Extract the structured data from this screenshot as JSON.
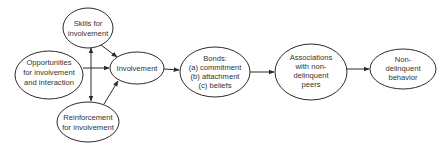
{
  "diagram": {
    "type": "flow-diagram",
    "colors": {
      "stroke": "#2b2b2b",
      "text": "#333333",
      "background": "#ffffff"
    },
    "nodes": [
      {
        "id": "skills",
        "lines": [
          "Skills for",
          "involvement"
        ],
        "cx": 88,
        "cy": 28,
        "rx": 25,
        "ry": 20
      },
      {
        "id": "opportunities",
        "lines": [
          "Opportunities",
          "for involvement",
          "and interaction"
        ],
        "cx": 49,
        "cy": 75,
        "rx": 34,
        "ry": 24
      },
      {
        "id": "reinforcement",
        "lines": [
          "Reinforcement",
          "for involvement"
        ],
        "cx": 88,
        "cy": 122,
        "rx": 31,
        "ry": 20
      },
      {
        "id": "involvement",
        "lines": [
          "Involvement"
        ],
        "cx": 137,
        "cy": 68,
        "rx": 27,
        "ry": 16
      },
      {
        "id": "bonds",
        "lines": [
          "Bonds:",
          "(a) commitment",
          "(b) attachment",
          "(c) beliefs"
        ],
        "cx": 215,
        "cy": 72,
        "rx": 35,
        "ry": 25
      },
      {
        "id": "associations",
        "lines": [
          "Associations",
          "with non-",
          "delinquent",
          "peers"
        ],
        "cx": 311,
        "cy": 72,
        "rx": 36,
        "ry": 28
      },
      {
        "id": "nondelinquent",
        "lines": [
          "Non-",
          "delinquent",
          "behavior"
        ],
        "cx": 403,
        "cy": 69,
        "rx": 33,
        "ry": 20
      }
    ],
    "edges": [
      {
        "from": "opportunities",
        "to": "involvement"
      },
      {
        "from": "skills",
        "to": "involvement"
      },
      {
        "from": "reinforcement",
        "to": "involvement"
      },
      {
        "from": "skills",
        "to": "reinforcement",
        "bidirectional": true
      },
      {
        "from": "involvement",
        "to": "bonds"
      },
      {
        "from": "bonds",
        "to": "associations"
      },
      {
        "from": "associations",
        "to": "nondelinquent"
      }
    ]
  }
}
